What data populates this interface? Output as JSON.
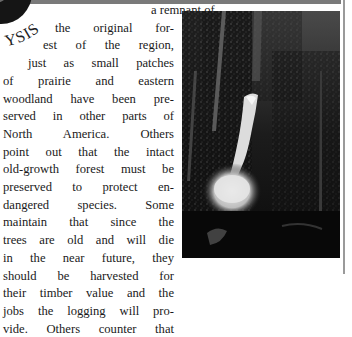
{
  "header": {
    "section_label": "YSIS",
    "logo_icon": "circle-emblem-icon"
  },
  "article": {
    "lines": [
      {
        "text": "a remnant of",
        "indent": 148
      },
      {
        "text": "the original for-",
        "indent": 52
      },
      {
        "text": "est of the region,",
        "indent": 40
      },
      {
        "text": "just as small patches",
        "indent": 25
      },
      {
        "text": "of prairie and eastern",
        "indent": 0
      },
      {
        "text": "woodland have been pre-",
        "indent": 0
      },
      {
        "text": "served in other parts of",
        "indent": 0
      },
      {
        "text": "North America. Others",
        "indent": 0
      },
      {
        "text": "point out that the intact",
        "indent": 0
      },
      {
        "text": "old-growth forest must be",
        "indent": 0
      },
      {
        "text": "preserved to protect en-",
        "indent": 0
      },
      {
        "text": "dangered species. Some",
        "indent": 0
      },
      {
        "text": "maintain that since the",
        "indent": 0
      },
      {
        "text": "trees are old and will die",
        "indent": 0
      },
      {
        "text": "in the near future, they",
        "indent": 0
      },
      {
        "text": "should be harvested for",
        "indent": 0
      },
      {
        "text": "their timber value and the",
        "indent": 0
      },
      {
        "text": "jobs the logging will pro-",
        "indent": 0
      },
      {
        "text": "vide. Others counter that",
        "indent": 0
      }
    ]
  },
  "figure": {
    "colors": {
      "dark": "#0c0c0c",
      "foliage": "#3a3a3a",
      "water": "#e6e6e6"
    }
  }
}
